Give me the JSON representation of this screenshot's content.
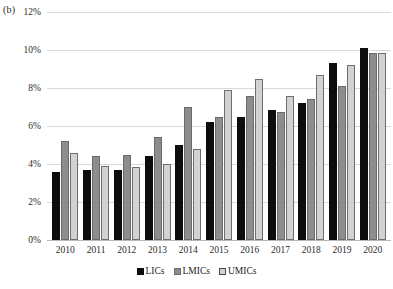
{
  "panel": {
    "label": "(b)"
  },
  "legend": {
    "position": "bottom-center",
    "items": [
      {
        "label": "LICs",
        "color": "#0d0d0d",
        "swatch": "filled-square-black"
      },
      {
        "label": "LMICs",
        "color": "#8d8d8d",
        "swatch": "filled-square-gray"
      },
      {
        "label": "UMICs",
        "color": "#d2d2d2",
        "swatch": "outlined-square-light-gray"
      }
    ]
  },
  "axes": {
    "yticks": [
      "0%",
      "2%",
      "4%",
      "6%",
      "8%",
      "10%",
      "12%"
    ],
    "ytick_values": [
      0,
      2,
      4,
      6,
      8,
      10,
      12
    ],
    "xticks": [
      "2010",
      "2011",
      "2012",
      "2013",
      "2014",
      "2015",
      "2016",
      "2017",
      "2018",
      "2019",
      "2020"
    ]
  },
  "chart_data": {
    "type": "bar",
    "title": "",
    "subtitle": "",
    "xlabel": "",
    "ylabel": "",
    "annotations": [
      "(b)"
    ],
    "categories": [
      "2010",
      "2011",
      "2012",
      "2013",
      "2014",
      "2015",
      "2016",
      "2017",
      "2018",
      "2019",
      "2020"
    ],
    "series": [
      {
        "name": "LICs",
        "color": "#0d0d0d",
        "values": [
          3.6,
          3.7,
          3.7,
          4.4,
          5.0,
          6.2,
          6.5,
          6.85,
          7.2,
          9.3,
          10.1
        ]
      },
      {
        "name": "LMICs",
        "color": "#8d8d8d",
        "values": [
          5.2,
          4.4,
          4.5,
          5.4,
          7.0,
          6.5,
          7.6,
          6.75,
          7.4,
          8.1,
          9.85
        ]
      },
      {
        "name": "UMICs",
        "color": "#d2d2d2",
        "values": [
          4.6,
          3.9,
          3.85,
          4.0,
          4.8,
          7.9,
          8.5,
          7.6,
          8.7,
          9.2,
          9.85
        ]
      }
    ],
    "ylim": [
      0,
      12
    ],
    "ytick_step": 2,
    "yunit": "%",
    "grid": true,
    "grid_axis": "y",
    "legend_position": "bottom-center"
  }
}
